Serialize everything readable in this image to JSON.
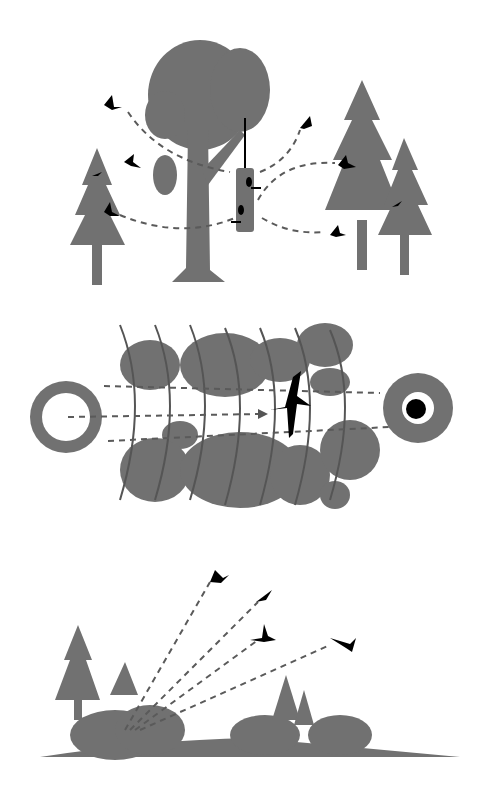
{
  "colors": {
    "background": "#ffffff",
    "vegetation": "#717171",
    "bird": "#000000",
    "path": "#5a5a5a"
  },
  "panels": [
    {
      "id": "feeder-scene",
      "description": "Birds flying between trees and a hanging tube bird feeder"
    },
    {
      "id": "corridor-scene",
      "description": "Top-down view of bird flying along a vegetated corridor between two habitat patches"
    },
    {
      "id": "flush-scene",
      "description": "Birds flushing from shrubs and trees on a hillside"
    }
  ]
}
